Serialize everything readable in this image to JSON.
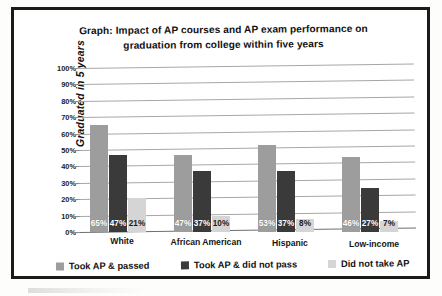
{
  "chart_data": {
    "type": "bar",
    "title": "Graph: Impact of AP courses and AP exam performance on graduation from college within five years",
    "title_line1": "Graph: Impact of AP courses and AP exam performance on",
    "title_line2": "graduation from college within five years",
    "xlabel": "",
    "ylabel": "Graduated in 5 years",
    "ylim": [
      0,
      100
    ],
    "ytick_labels": [
      "100%",
      "90%",
      "80%",
      "70%",
      "60%",
      "50%",
      "40%",
      "30%",
      "20%",
      "10%",
      "0%"
    ],
    "ytick_values": [
      100,
      90,
      80,
      70,
      60,
      50,
      40,
      30,
      20,
      10,
      0
    ],
    "grid": true,
    "legend_position": "bottom",
    "categories": [
      "White",
      "African American",
      "Hispanic",
      "Low-income"
    ],
    "series": [
      {
        "name": "Took AP & passed",
        "color": "#9d9d9d",
        "values": [
          65,
          47,
          53,
          46
        ],
        "labels": [
          "65%",
          "47%",
          "53%",
          "46%"
        ]
      },
      {
        "name": "Took AP & did not pass",
        "color": "#3a3a3a",
        "values": [
          47,
          37,
          37,
          27
        ],
        "labels": [
          "47%",
          "37%",
          "37%",
          "27%"
        ]
      },
      {
        "name": "Did not take AP",
        "color": "#d5d5d5",
        "values": [
          21,
          10,
          8,
          7
        ],
        "labels": [
          "21%",
          "10%",
          "8%",
          "7%"
        ]
      }
    ],
    "data_by_category": {
      "White": {
        "Took AP & passed": 65,
        "Took AP & did not pass": 47,
        "Did not take AP": 21
      },
      "African American": {
        "Took AP & passed": 53,
        "Took AP & did not pass": 37,
        "Did not take AP": 10
      },
      "Hispanic": {
        "Took AP & passed": 53,
        "Took AP & did not pass": 37,
        "Did not take AP": 8
      },
      "Low-income": {
        "Took AP & passed": 46,
        "Took AP & did not pass": 27,
        "Did not take AP": 7
      }
    }
  },
  "colors": {
    "frame": "#1b1b1b",
    "gridline": "#a7a7a7",
    "text": "#111111",
    "series_passed": "#9d9d9d",
    "series_not_passed": "#3a3a3a",
    "series_no_ap": "#d5d5d5"
  }
}
